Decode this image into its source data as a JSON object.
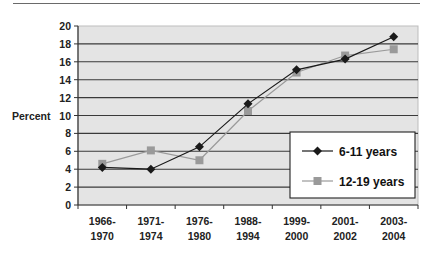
{
  "chart_data": {
    "type": "line",
    "title": "",
    "xlabel": "",
    "ylabel": "Percent",
    "ylim": [
      0,
      20
    ],
    "yticks": [
      0,
      2,
      4,
      6,
      8,
      10,
      12,
      14,
      16,
      18,
      20
    ],
    "grid": true,
    "legend_position": "lower right inside plot",
    "categories": [
      [
        "1966-",
        "1970"
      ],
      [
        "1971-",
        "1974"
      ],
      [
        "1976-",
        "1980"
      ],
      [
        "1988-",
        "1994"
      ],
      [
        "1999-",
        "2000"
      ],
      [
        "2001-",
        "2002"
      ],
      [
        "2003-",
        "2004"
      ]
    ],
    "category_labels": [
      "1966-1970",
      "1971-1974",
      "1976-1980",
      "1988-1994",
      "1999-2000",
      "2001-2002",
      "2003-2004"
    ],
    "series": [
      {
        "name": "6-11 years",
        "marker": "diamond",
        "color": "#1a1a1a",
        "values": [
          4.2,
          4.0,
          6.5,
          11.3,
          15.1,
          16.3,
          18.8
        ]
      },
      {
        "name": "12-19 years",
        "marker": "square",
        "color": "#9a9a9a",
        "values": [
          4.6,
          6.1,
          5.0,
          10.5,
          14.8,
          16.7,
          17.4
        ]
      }
    ]
  },
  "colors": {
    "plot_background": "#e4e4e4",
    "gridline": "#3a3a3a",
    "series1": "#1a1a1a",
    "series2": "#9a9a9a"
  }
}
